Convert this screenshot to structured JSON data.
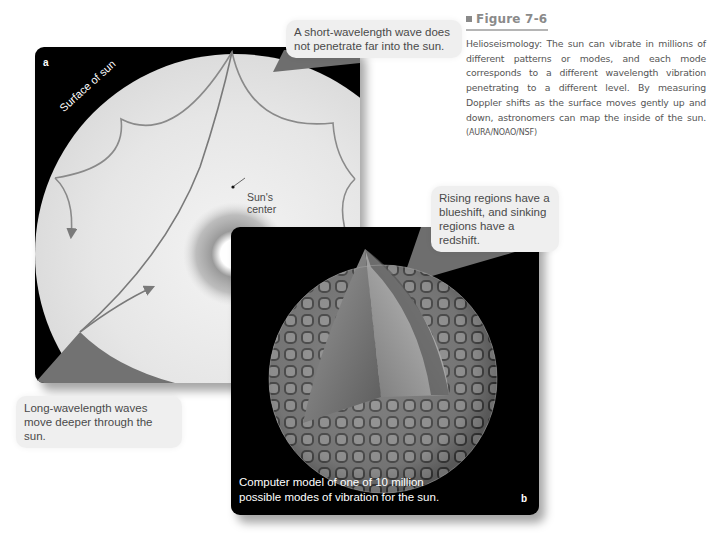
{
  "figure": {
    "number_label": "Figure 7-6",
    "caption": "Helioseismology: The sun can vibrate in millions of different patterns or modes, and each mode corresponds to a different wavelength vibration penetrating to a different level. By measuring Doppler shifts as the surface moves gently up and down, astronomers can map the inside of the sun.",
    "credit": "(AURA/NOAO/NSF)"
  },
  "panel_a": {
    "letter": "a",
    "surface_label": "Surface of sun",
    "center_label_line1": "Sun's",
    "center_label_line2": "center",
    "callout_short_wave_line1": "A short-wavelength wave does",
    "callout_short_wave_line2": "not penetrate far into the sun.",
    "callout_long_wave_line1": "Long-wavelength waves",
    "callout_long_wave_line2": "move deeper through the sun."
  },
  "panel_b": {
    "letter": "b",
    "callout_doppler_line1": "Rising regions have a",
    "callout_doppler_line2": "blueshift, and sinking",
    "callout_doppler_line3": "regions have a redshift.",
    "model_caption_line1": "Computer model of one of 10 million",
    "model_caption_line2": "possible modes of vibration for the sun."
  },
  "colors": {
    "panel_bg": "#000000",
    "callout_bg": "#efefef",
    "wave_line": "#7a7a7a",
    "callout_pointer": "#6e6e6e",
    "title_gray": "#8a8a8a"
  }
}
